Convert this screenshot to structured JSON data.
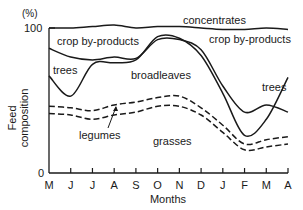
{
  "chart_data": {
    "type": "area",
    "title": "",
    "xlabel": "Months",
    "ylabel": "Feed composition",
    "yunit": "(%)",
    "ylim": [
      0,
      100
    ],
    "yticks": [
      "0",
      "100"
    ],
    "grid": false,
    "categories": [
      "M",
      "J",
      "J",
      "A",
      "S",
      "O",
      "N",
      "D",
      "J",
      "F",
      "M",
      "A"
    ],
    "boundaries": [
      {
        "name": "concentrates (upper bound)",
        "style": "solid",
        "values": [
          100,
          100,
          101,
          102,
          100,
          101,
          101,
          100,
          99,
          99,
          100,
          99
        ]
      },
      {
        "name": "crop by-products / trees boundary",
        "style": "solid",
        "values": [
          86,
          80,
          78,
          80,
          79,
          92,
          92,
          85,
          60,
          42,
          47,
          42
        ]
      },
      {
        "name": "trees / broadleaves boundary",
        "style": "solid",
        "values": [
          67,
          53,
          75,
          76,
          78,
          94,
          93,
          81,
          55,
          26,
          37,
          66
        ]
      },
      {
        "name": "broadleaves / legumes boundary",
        "style": "dashed",
        "values": [
          46,
          45,
          43,
          47,
          49,
          52,
          53,
          45,
          33,
          20,
          23,
          25
        ]
      },
      {
        "name": "legumes / grasses boundary",
        "style": "dashed",
        "values": [
          41,
          40,
          37,
          40,
          42,
          46,
          46,
          40,
          28,
          16,
          18,
          20
        ]
      }
    ],
    "series_labels": [
      {
        "name": "concentrates",
        "region": "top band"
      },
      {
        "name": "crop by-products",
        "region": "below concentrates"
      },
      {
        "name": "trees",
        "region": "between crop by-products and broadleaves"
      },
      {
        "name": "broadleaves",
        "region": "middle"
      },
      {
        "name": "legumes",
        "region": "between dashed lines"
      },
      {
        "name": "grasses",
        "region": "bottom"
      }
    ]
  },
  "labels": {
    "y_unit": "(%)",
    "y_top": "100",
    "y_bottom": "0",
    "y_title_1": "Feed",
    "y_title_2": "composition",
    "x_title": "Months",
    "concentrates": "concentrates",
    "crop_left": "crop by-products",
    "crop_right": "crop by-products",
    "trees_left": "trees",
    "trees_right": "trees",
    "broadleaves": "broadleaves",
    "legumes": "legumes",
    "grasses": "grasses"
  }
}
